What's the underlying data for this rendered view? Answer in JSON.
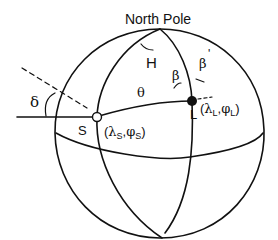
{
  "diagram": {
    "title": "North Pole",
    "labels": {
      "hour_angle": "H",
      "distance": "θ",
      "beta": "β",
      "beta_prime": "β",
      "beta_prime_mark": "'",
      "delta": "δ",
      "source": "S",
      "location": "L"
    },
    "coords": {
      "source": {
        "open": "(",
        "lambda": "λ",
        "lambda_sub": "S",
        "comma": ",",
        "phi": "φ",
        "phi_sub": "S",
        "close": ")"
      },
      "location": {
        "open": "(",
        "lambda": "λ",
        "lambda_sub": "L",
        "comma": ",",
        "phi": "φ",
        "phi_sub": "L",
        "close": ")"
      }
    },
    "colors": {
      "stroke": "#111111",
      "background": "#ffffff"
    }
  }
}
